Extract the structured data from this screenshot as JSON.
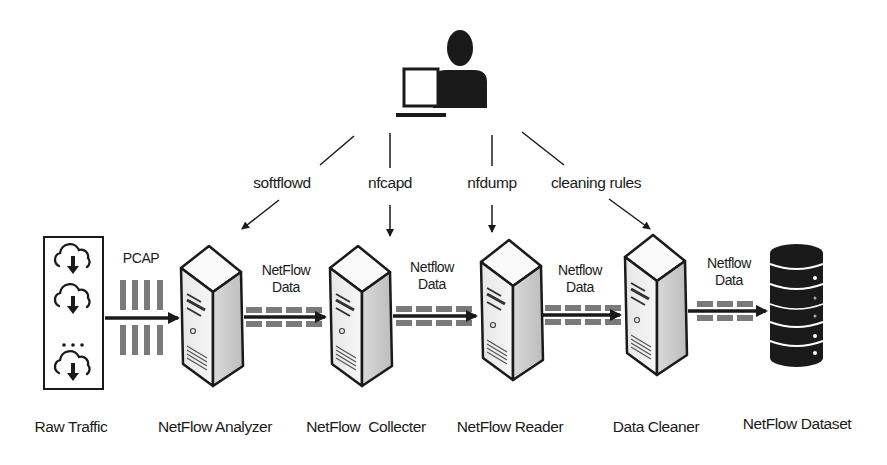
{
  "diagram": {
    "type": "netflow-processing-pipeline",
    "user": {
      "icon": "user-with-laptop-icon"
    },
    "tools": [
      {
        "label": "softflowd",
        "target": "NetFlow Analyzer"
      },
      {
        "label": "nfcapd",
        "target": "NetFlow Collecter"
      },
      {
        "label": "nfdump",
        "target": "NetFlow Reader"
      },
      {
        "label": "cleaning rules",
        "target": "Data Cleaner"
      }
    ],
    "nodes": [
      {
        "id": "raw",
        "label": "Raw Traffic",
        "icon": "cloud-download-icon",
        "ellipsis": "..."
      },
      {
        "id": "analyzer",
        "label": "NetFlow Analyzer",
        "icon": "server-icon"
      },
      {
        "id": "collector",
        "label": "NetFlow  Collecter",
        "icon": "server-icon"
      },
      {
        "id": "reader",
        "label": "NetFlow Reader",
        "icon": "server-icon"
      },
      {
        "id": "cleaner",
        "label": "Data Cleaner",
        "icon": "server-icon"
      },
      {
        "id": "dataset",
        "label": "NetFlow Dataset",
        "icon": "database-icon"
      }
    ],
    "edges": [
      {
        "from": "raw",
        "to": "analyzer",
        "label": "PCAP"
      },
      {
        "from": "analyzer",
        "to": "collector",
        "label_line1": "NetFlow",
        "label_line2": "Data"
      },
      {
        "from": "collector",
        "to": "reader",
        "label_line1": "Netflow",
        "label_line2": "Data"
      },
      {
        "from": "reader",
        "to": "cleaner",
        "label_line1": "Netflow",
        "label_line2": "Data"
      },
      {
        "from": "cleaner",
        "to": "dataset",
        "label_line1": "Netflow",
        "label_line2": "Data"
      }
    ],
    "colors": {
      "ink": "#1a1a1a",
      "packet": "#7a7a7a",
      "server_light": "#f2f2f2",
      "server_shade": "#c8c8c8"
    }
  }
}
